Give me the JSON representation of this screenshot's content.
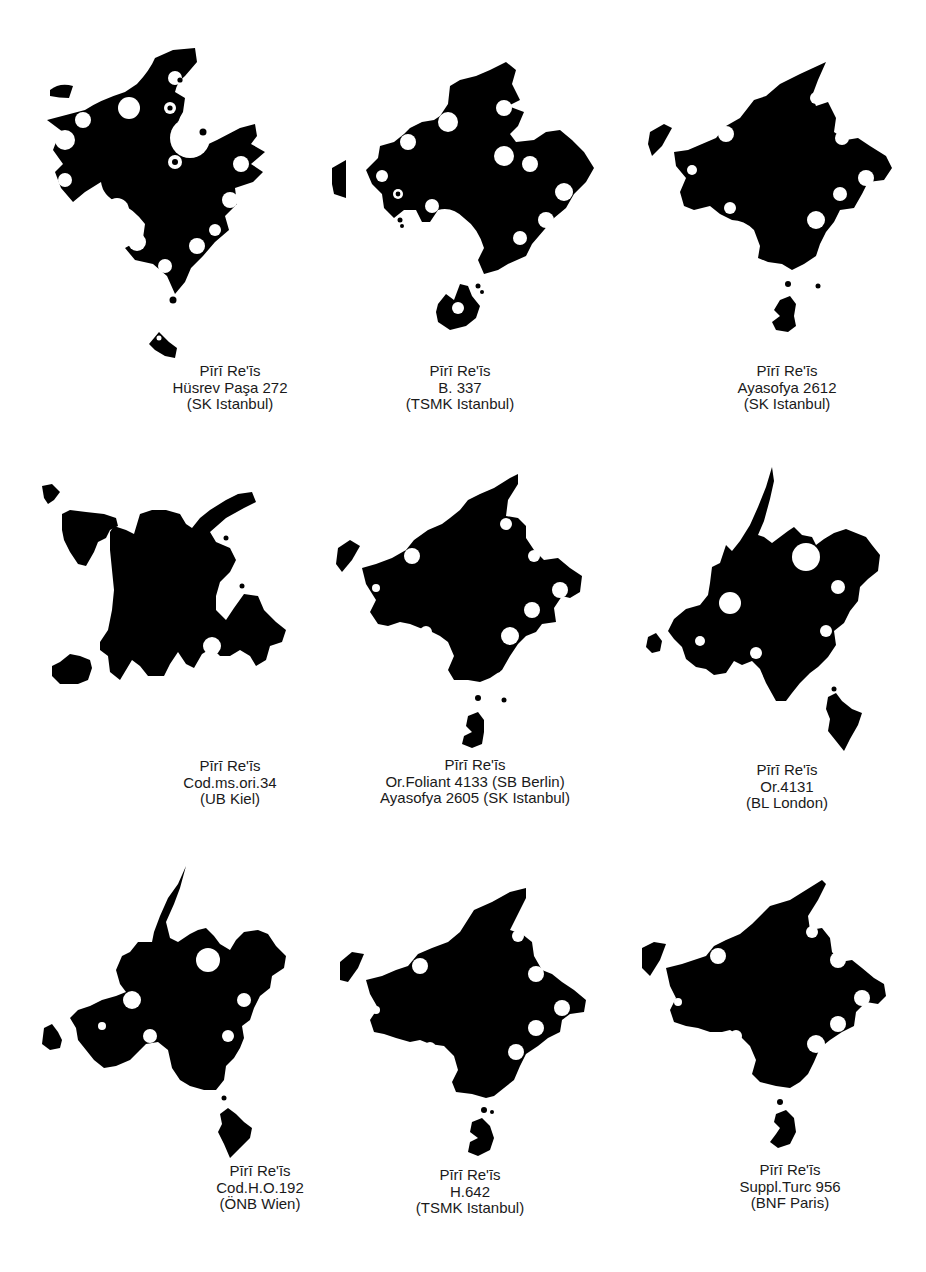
{
  "figure": {
    "background": "#ffffff",
    "silhouette_color": "#000000",
    "layout": {
      "rows": 3,
      "columns": 3
    },
    "panels": [
      {
        "id": "panel-1",
        "caption": [
          "Pīrī Re'īs",
          "Hüsrev Paşa 272",
          "(SK Istanbul)"
        ]
      },
      {
        "id": "panel-2",
        "caption": [
          "Pīrī Re'īs",
          "B. 337",
          "(TSMK Istanbul)"
        ]
      },
      {
        "id": "panel-3",
        "caption": [
          "Pīrī Re'īs",
          "Ayasofya 2612",
          "(SK Istanbul)"
        ]
      },
      {
        "id": "panel-4",
        "caption": [
          "Pīrī Re'īs",
          "Cod.ms.ori.34",
          "(UB Kiel)"
        ]
      },
      {
        "id": "panel-5",
        "caption": [
          "Pīrī Re'īs",
          "Or.Foliant 4133 (SB Berlin)",
          "Ayasofya 2605 (SK Istanbul)"
        ]
      },
      {
        "id": "panel-6",
        "caption": [
          "Pīrī Re'īs",
          "Or.4131",
          "(BL London)"
        ]
      },
      {
        "id": "panel-7",
        "caption": [
          "Pīrī Re'īs",
          "Cod.H.O.192",
          "(ÖNB Wien)"
        ]
      },
      {
        "id": "panel-8",
        "caption": [
          "Pīrī Re'īs",
          "H.642",
          "(TSMK Istanbul)"
        ]
      },
      {
        "id": "panel-9",
        "caption": [
          "Pīrī Re'īs",
          "Suppl.Turc 956",
          "(BNF Paris)"
        ]
      }
    ]
  }
}
